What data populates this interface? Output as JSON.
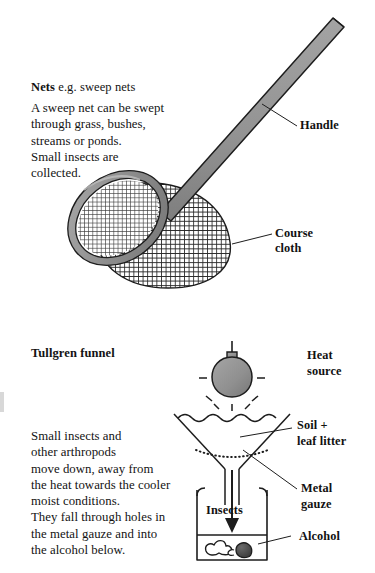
{
  "figure": {
    "background_color": "#ffffff",
    "ink_color": "#131313",
    "metal_gray": "#8c8c8c",
    "bulb_gray": "#8f8f8f",
    "mesh_gray": "#3a3a3a"
  },
  "nets": {
    "heading_bold": "Nets",
    "heading_rest": " e.g. sweep nets",
    "body": "A sweep net can be swept\nthrough grass, bushes,\nstreams or ponds.\nSmall insects are\ncollected.",
    "labels": {
      "handle": "Handle",
      "cloth_line1": "Course",
      "cloth_line2": "cloth"
    }
  },
  "tullgren": {
    "heading": "Tullgren funnel",
    "body": "Small insects and\nother arthropods\nmove down, away from\nthe heat towards the cooler\nmoist conditions.\nThey fall through holes in\nthe metal gauze and into\nthe alcohol below.",
    "labels": {
      "heat_line1": "Heat",
      "heat_line2": "source",
      "soil_line1": "Soil +",
      "soil_line2": "leaf litter",
      "gauze_line1": "Metal",
      "gauze_line2": "gauze",
      "alcohol": "Alcohol",
      "insects": "Insects"
    }
  }
}
